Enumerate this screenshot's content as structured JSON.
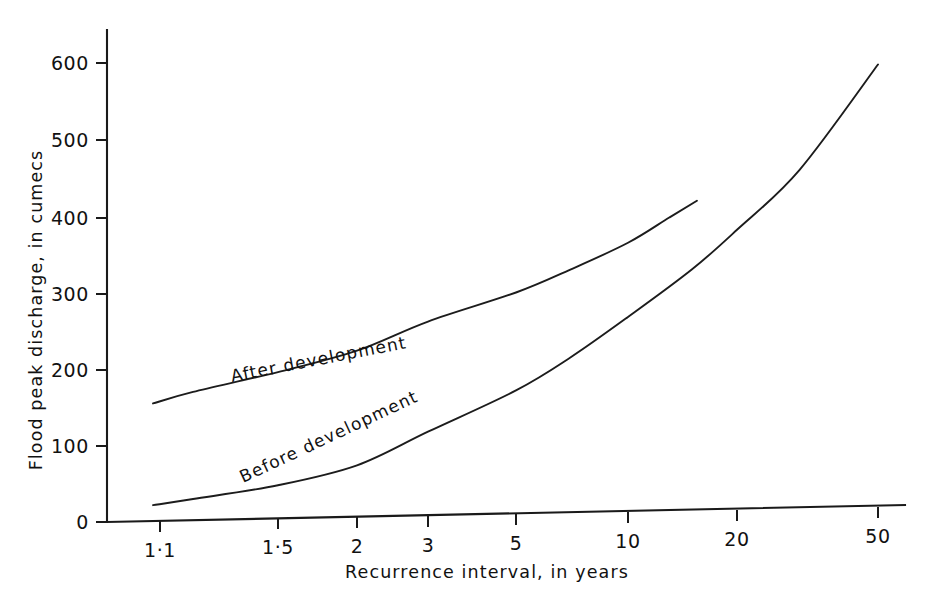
{
  "chart_data": {
    "type": "line",
    "title": "",
    "subtitle": "",
    "xlabel": "Recurrence interval, in years",
    "ylabel": "Flood peak discharge, in cumecs",
    "x_scale": "gumbel-probability",
    "y_scale": "linear",
    "xlim": [
      1.05,
      60
    ],
    "ylim": [
      0,
      650
    ],
    "grid": false,
    "legend_position": "inline-curve-labels",
    "x_ticks": [
      {
        "value": 1.1,
        "label": "1·1",
        "px": 160
      },
      {
        "value": 1.5,
        "label": "1·5",
        "px": 278
      },
      {
        "value": 2,
        "label": "2",
        "px": 357
      },
      {
        "value": 3,
        "label": "3",
        "px": 428
      },
      {
        "value": 5,
        "label": "5",
        "px": 516
      },
      {
        "value": 10,
        "label": "10",
        "px": 628
      },
      {
        "value": 20,
        "label": "20",
        "px": 737
      },
      {
        "value": 50,
        "label": "50",
        "px": 878
      }
    ],
    "y_ticks": [
      {
        "value": 0,
        "label": "0",
        "px": 522
      },
      {
        "value": 100,
        "label": "100",
        "px": 446
      },
      {
        "value": 200,
        "label": "200",
        "px": 370
      },
      {
        "value": 300,
        "label": "300",
        "px": 294
      },
      {
        "value": 400,
        "label": "400",
        "px": 218
      },
      {
        "value": 500,
        "label": "500",
        "px": 140
      },
      {
        "value": 600,
        "label": "600",
        "px": 63
      }
    ],
    "series": [
      {
        "name": "After development",
        "label": "After  development",
        "label_angle": -11,
        "label_x": 232,
        "label_y": 382,
        "points": [
          {
            "x": 1.08,
            "y": 155
          },
          {
            "x": 1.2,
            "y": 170
          },
          {
            "x": 1.5,
            "y": 196
          },
          {
            "x": 2.0,
            "y": 224
          },
          {
            "x": 3.0,
            "y": 262
          },
          {
            "x": 5.0,
            "y": 300
          },
          {
            "x": 7.0,
            "y": 330
          },
          {
            "x": 10.0,
            "y": 365
          },
          {
            "x": 13.0,
            "y": 398
          },
          {
            "x": 15.5,
            "y": 420
          }
        ]
      },
      {
        "name": "Before development",
        "label": "Before  development",
        "label_angle": -25,
        "label_x": 243,
        "label_y": 483,
        "points": [
          {
            "x": 1.08,
            "y": 22
          },
          {
            "x": 1.2,
            "y": 30
          },
          {
            "x": 1.5,
            "y": 48
          },
          {
            "x": 2.0,
            "y": 74
          },
          {
            "x": 3.0,
            "y": 118
          },
          {
            "x": 5.0,
            "y": 172
          },
          {
            "x": 7.0,
            "y": 215
          },
          {
            "x": 10.0,
            "y": 268
          },
          {
            "x": 15.0,
            "y": 330
          },
          {
            "x": 20.0,
            "y": 382
          },
          {
            "x": 30.0,
            "y": 460
          },
          {
            "x": 50.0,
            "y": 598
          }
        ]
      }
    ]
  },
  "geometry": {
    "axis_x0": 107,
    "axis_y0": 522,
    "axis_top": 30,
    "axis_right": 905,
    "x_axis_right_y": 505
  }
}
